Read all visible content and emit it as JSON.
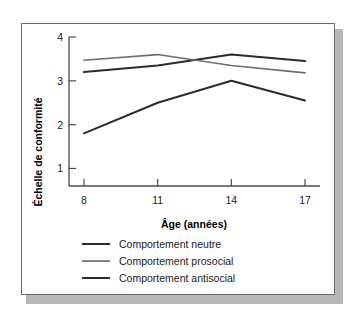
{
  "chart_data": {
    "type": "line",
    "title": "",
    "xlabel": "Âge (années)",
    "ylabel": "Échelle de conformité",
    "categories": [
      "8",
      "11",
      "14",
      "17"
    ],
    "x": [
      8,
      11,
      14,
      17
    ],
    "xlim": [
      8,
      17
    ],
    "ylim": [
      0.6,
      4
    ],
    "yticks": [
      "1",
      "2",
      "3",
      "4"
    ],
    "ytick_values": [
      1,
      2,
      3,
      4
    ],
    "grid": false,
    "legend_position": "bottom-left",
    "series": [
      {
        "name": "Comportement neutre",
        "values": [
          3.2,
          3.35,
          3.6,
          3.45
        ],
        "color": "#2b2b2b",
        "width": 2.0
      },
      {
        "name": "Comportement prosocial",
        "values": [
          3.47,
          3.6,
          3.35,
          3.18
        ],
        "color": "#6e6e6e",
        "width": 1.7
      },
      {
        "name": "Comportement antisocial",
        "values": [
          1.8,
          2.5,
          3.0,
          2.55
        ],
        "color": "#2b2b2b",
        "width": 2.0
      }
    ]
  },
  "legend": {
    "items": [
      {
        "label": "Comportement neutre"
      },
      {
        "label": "Comportement prosocial"
      },
      {
        "label": "Comportement antisocial"
      }
    ]
  },
  "axes": {
    "y_label": "Échelle de conformité",
    "x_label": "Âge (années)",
    "y_ticks": [
      "4",
      "3",
      "2",
      "1"
    ],
    "x_ticks": [
      "8",
      "11",
      "14",
      "17"
    ]
  },
  "colors": {
    "frame": "#6b6b6b",
    "shadow": "#b8b8b8",
    "axis": "#4a4a4a",
    "dark_series": "#2b2b2b",
    "gray_series": "#6e6e6e",
    "background": "#ffffff"
  }
}
